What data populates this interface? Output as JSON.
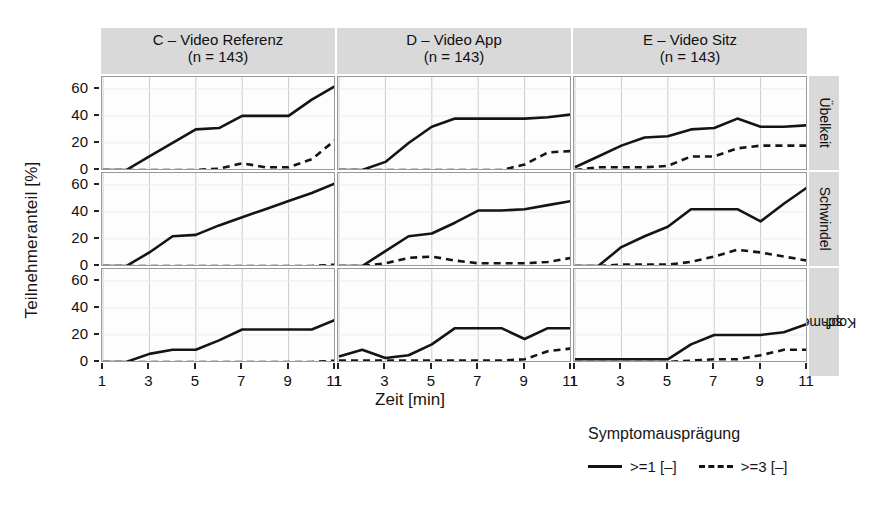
{
  "figure": {
    "ylabel": "Teilnehmeranteil [%]",
    "xlabel": "Zeit [min]",
    "y_ticks": [
      "0",
      "20",
      "40",
      "60"
    ],
    "x_ticks": [
      "1",
      "3",
      "5",
      "7",
      "9",
      "11"
    ]
  },
  "columns": [
    {
      "id": "C",
      "line1": "C – Video Referenz",
      "line2": "(n = 143)"
    },
    {
      "id": "D",
      "line1": "D – Video App",
      "line2": "(n = 143)"
    },
    {
      "id": "E",
      "line1": "E – Video Sitz",
      "line2": "(n = 143)"
    }
  ],
  "rows": [
    {
      "id": "uebelkeit",
      "label": "Übelkeit"
    },
    {
      "id": "schwindel",
      "label": "Schwindel"
    },
    {
      "id": "kopfschmerzen",
      "label": "Kopf-\nschmerzen",
      "label_l1": "Kopf-",
      "label_l2": "schmerzen"
    }
  ],
  "legend": {
    "title": "Symptomausprägung",
    "entries": [
      {
        "label": ">=1 [–]",
        "style": "solid"
      },
      {
        "label": ">=3 [–]",
        "style": "dashed"
      }
    ]
  },
  "chart_data": {
    "type": "line",
    "title": "",
    "xlabel": "Zeit [min]",
    "ylabel": "Teilnehmeranteil [%]",
    "xlim": [
      1,
      11
    ],
    "ylim": [
      0,
      68
    ],
    "yticks": [
      0,
      20,
      40,
      60
    ],
    "xticks": [
      1,
      3,
      5,
      7,
      9,
      11
    ],
    "grid": true,
    "legend_position": "bottom-right",
    "legend_title": "Symptomausprägung",
    "facet_columns": [
      "C – Video Referenz (n = 143)",
      "D – Video App (n = 143)",
      "E – Video Sitz (n = 143)"
    ],
    "facet_rows": [
      "Übelkeit",
      "Schwindel",
      "Kopf-schmerzen"
    ],
    "x": [
      1,
      2,
      3,
      4,
      5,
      6,
      7,
      8,
      9,
      10,
      11
    ],
    "panels": [
      {
        "row": "Übelkeit",
        "column": "C – Video Referenz",
        "series": [
          {
            "name": ">=1 [–]",
            "style": "solid",
            "values": [
              0,
              0,
              10,
              20,
              30,
              31,
              40,
              40,
              40,
              52,
              62
            ]
          },
          {
            "name": ">=3 [–]",
            "style": "dashed",
            "values": [
              0,
              0,
              0,
              0,
              0,
              1,
              5,
              2,
              2,
              8,
              22
            ]
          }
        ]
      },
      {
        "row": "Übelkeit",
        "column": "D – Video App",
        "series": [
          {
            "name": ">=1 [–]",
            "style": "solid",
            "values": [
              0,
              0,
              6,
              20,
              32,
              38,
              38,
              38,
              38,
              39,
              41
            ]
          },
          {
            "name": ">=3 [–]",
            "style": "dashed",
            "values": [
              0,
              0,
              0,
              0,
              0,
              0,
              0,
              0,
              4,
              13,
              14
            ]
          }
        ]
      },
      {
        "row": "Übelkeit",
        "column": "E – Video Sitz",
        "series": [
          {
            "name": ">=1 [–]",
            "style": "solid",
            "values": [
              2,
              10,
              18,
              24,
              25,
              30,
              31,
              38,
              32,
              32,
              33
            ]
          },
          {
            "name": ">=3 [–]",
            "style": "dashed",
            "values": [
              0,
              2,
              2,
              2,
              3,
              10,
              10,
              16,
              18,
              18,
              18
            ]
          }
        ]
      },
      {
        "row": "Schwindel",
        "column": "C – Video Referenz",
        "series": [
          {
            "name": ">=1 [–]",
            "style": "solid",
            "values": [
              0,
              0,
              10,
              22,
              23,
              30,
              36,
              42,
              48,
              54,
              61
            ]
          },
          {
            "name": ">=3 [–]",
            "style": "dashed",
            "values": [
              0,
              0,
              0,
              0,
              0,
              0,
              0,
              0,
              0,
              0,
              1
            ]
          }
        ]
      },
      {
        "row": "Schwindel",
        "column": "D – Video App",
        "series": [
          {
            "name": ">=1 [–]",
            "style": "solid",
            "values": [
              0,
              0,
              11,
              22,
              24,
              32,
              41,
              41,
              42,
              45,
              48
            ]
          },
          {
            "name": ">=3 [–]",
            "style": "dashed",
            "values": [
              0,
              0,
              2,
              6,
              7,
              4,
              2,
              2,
              2,
              3,
              6
            ]
          }
        ]
      },
      {
        "row": "Schwindel",
        "column": "E – Video Sitz",
        "series": [
          {
            "name": ">=1 [–]",
            "style": "solid",
            "values": [
              0,
              0,
              14,
              22,
              29,
              42,
              42,
              42,
              33,
              46,
              58
            ]
          },
          {
            "name": ">=3 [–]",
            "style": "dashed",
            "values": [
              0,
              0,
              1,
              1,
              1,
              3,
              7,
              12,
              10,
              7,
              4
            ]
          }
        ]
      },
      {
        "row": "Kopf-schmerzen",
        "column": "C – Video Referenz",
        "series": [
          {
            "name": ">=1 [–]",
            "style": "solid",
            "values": [
              0,
              0,
              6,
              9,
              9,
              16,
              24,
              24,
              24,
              24,
              31
            ]
          },
          {
            "name": ">=3 [–]",
            "style": "dashed",
            "values": [
              0,
              0,
              0,
              0,
              0,
              0,
              0,
              0,
              0,
              0,
              1
            ]
          }
        ]
      },
      {
        "row": "Kopf-schmerzen",
        "column": "D – Video App",
        "series": [
          {
            "name": ">=1 [–]",
            "style": "solid",
            "values": [
              4,
              9,
              3,
              5,
              13,
              25,
              25,
              25,
              17,
              25,
              25
            ]
          },
          {
            "name": ">=3 [–]",
            "style": "dashed",
            "values": [
              1,
              1,
              1,
              1,
              1,
              1,
              1,
              1,
              2,
              8,
              10
            ]
          }
        ]
      },
      {
        "row": "Kopf-schmerzen",
        "column": "E – Video Sitz",
        "series": [
          {
            "name": ">=1 [–]",
            "style": "solid",
            "values": [
              2,
              2,
              2,
              2,
              2,
              13,
              20,
              20,
              20,
              22,
              28
            ]
          },
          {
            "name": ">=3 [–]",
            "style": "dashed",
            "values": [
              0,
              0,
              0,
              0,
              0,
              1,
              2,
              2,
              5,
              9,
              9
            ]
          }
        ]
      }
    ]
  }
}
